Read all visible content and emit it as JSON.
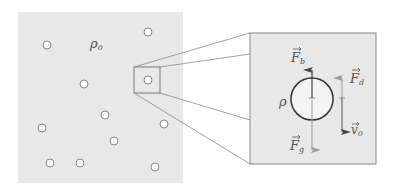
{
  "diagram": {
    "fluid_panel": {
      "label": "ρ",
      "label_subscript": "0",
      "background": "#e8e8e8",
      "particles": [
        {
          "x": 47,
          "y": 45
        },
        {
          "x": 148,
          "y": 32
        },
        {
          "x": 84,
          "y": 84
        },
        {
          "x": 148,
          "y": 80
        },
        {
          "x": 105,
          "y": 115
        },
        {
          "x": 42,
          "y": 128
        },
        {
          "x": 164,
          "y": 124
        },
        {
          "x": 114,
          "y": 141
        },
        {
          "x": 50,
          "y": 163
        },
        {
          "x": 80,
          "y": 163
        },
        {
          "x": 155,
          "y": 167
        }
      ]
    },
    "inset_panel": {
      "particle_density_label": "ρ",
      "forces": [
        {
          "id": "buoyancy",
          "label": "F",
          "subscript": "b",
          "direction": "up"
        },
        {
          "id": "drag",
          "label": "F",
          "subscript": "d",
          "direction": "up"
        },
        {
          "id": "gravity",
          "label": "F",
          "subscript": "g",
          "direction": "down"
        }
      ],
      "velocity": {
        "label": "v",
        "subscript": "0",
        "direction": "down"
      }
    },
    "colors": {
      "panel_fill": "#e8e8e8",
      "stroke": "#777777",
      "arrow_dark": "#444444",
      "arrow_light": "#999999"
    }
  }
}
